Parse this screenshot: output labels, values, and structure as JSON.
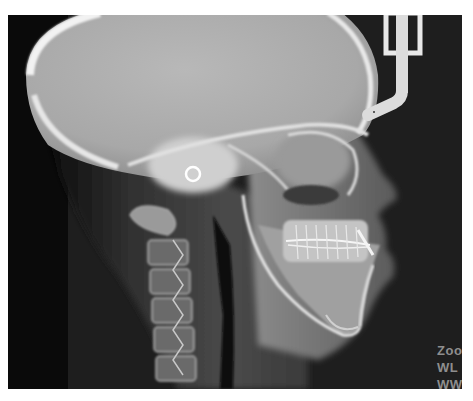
{
  "viewer": {
    "image_type": "lateral cephalometric radiograph",
    "background_color": "#1c1c1c",
    "bone_color": "#d8d8d8",
    "soft_tissue_color": "#5a5a5a"
  },
  "overlay": {
    "zoom_label": "Zoo",
    "wl_label": "WL",
    "ww_label": "WW"
  },
  "icons": {
    "ear_rod_ring": "ring",
    "nasion_positioner": "nasal-rod"
  }
}
